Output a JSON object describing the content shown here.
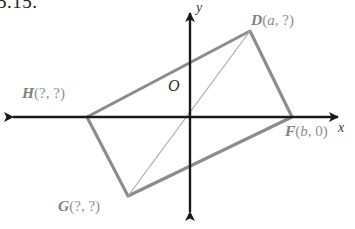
{
  "figure": {
    "problem_number": "5.15.",
    "axis_labels": {
      "x": "x",
      "y": "y",
      "origin": "O"
    },
    "vertices": [
      {
        "id": "D",
        "name": "D",
        "coords": "(a, ?)",
        "x": 250,
        "y": 31
      },
      {
        "id": "H",
        "name": "H",
        "coords": "(?, ?)",
        "x": 87,
        "y": 117
      },
      {
        "id": "F",
        "name": "F",
        "coords": "(b, 0)",
        "x": 292,
        "y": 117
      },
      {
        "id": "G",
        "name": "G",
        "coords": "(?, ?)",
        "x": 128,
        "y": 196
      }
    ],
    "labels": {
      "D": {
        "point": "D",
        "open": "(",
        "arg1": "a",
        "sep": ", ",
        "arg2": "?",
        "close": ")"
      },
      "H": {
        "point": "H",
        "open": "(",
        "arg1": "?",
        "sep": ", ",
        "arg2": "?",
        "close": ")"
      },
      "F": {
        "point": "F",
        "open": "(",
        "arg1": "b",
        "sep": ", ",
        "arg2": "0",
        "close": ")"
      },
      "G": {
        "point": "G",
        "open": "(",
        "arg1": "?",
        "sep": ", ",
        "arg2": "?",
        "close": ")"
      }
    },
    "colors": {
      "axis": "#1a1a1a",
      "shape_outline": "#8c8c8c",
      "diagonal": "#a8a8a8",
      "label_text": "#8a8a8a",
      "background": "#ffffff"
    },
    "geometry": {
      "origin": {
        "x": 190,
        "y": 117
      },
      "x_axis": {
        "x1": 4,
        "y1": 117,
        "x2": 347,
        "y2": 117
      },
      "y_axis": {
        "x1": 190,
        "y1": 4,
        "x2": 190,
        "y2": 221
      },
      "parallelogram_path": "M 87 117 L 250 31 L 292 117 L 128 196 Z",
      "diagonal_path": "M 128 196 L 250 31"
    }
  }
}
